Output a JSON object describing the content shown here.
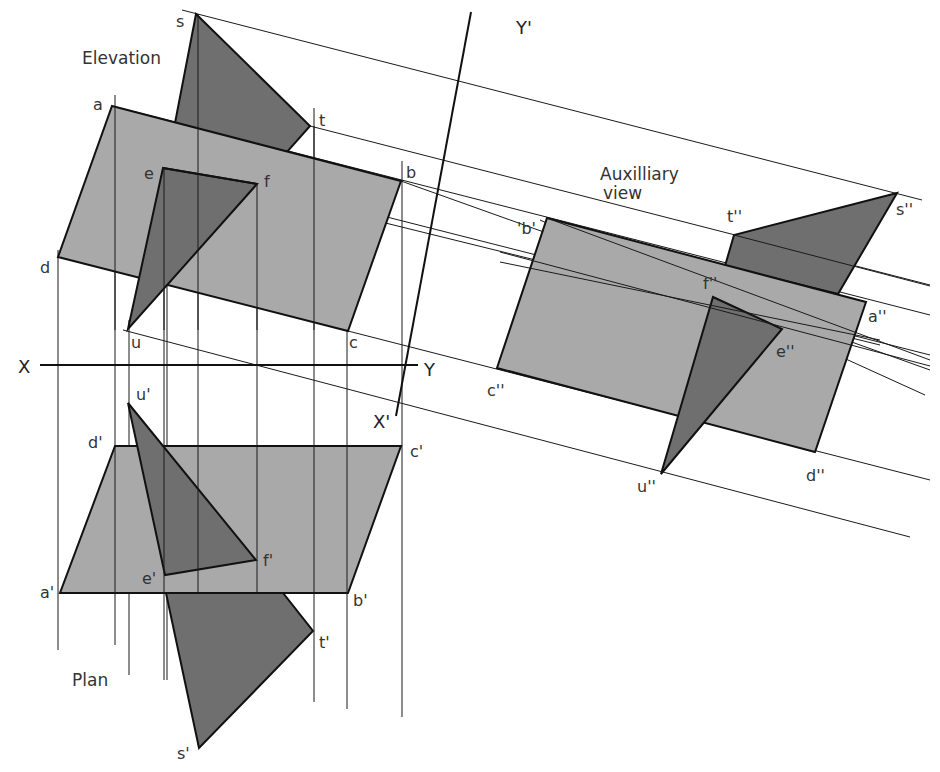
{
  "diagram": {
    "type": "orthographic-projection-with-auxiliary-view",
    "view_titles": {
      "elevation": "Elevation",
      "plan": "Plan",
      "auxiliary_line1": "Auxilliary",
      "auxiliary_line2": "view"
    },
    "reference_lines": {
      "x": "X",
      "y": "Y",
      "x_prime": "X'",
      "y_prime": "Y'"
    },
    "elevation_points": {
      "a": "a",
      "b": "b",
      "c": "c",
      "d": "d",
      "e": "e",
      "f": "f",
      "s": "s",
      "t": "t",
      "u": "u"
    },
    "plan_points": {
      "a": "a'",
      "b": "b'",
      "c": "c'",
      "d": "d'",
      "e": "e'",
      "f": "f'",
      "s": "s'",
      "t": "t'",
      "u": "u'"
    },
    "auxiliary_points": {
      "a": "a''",
      "b": "'b'",
      "c": "c''",
      "d": "d''",
      "e": "e''",
      "f": "f''",
      "s": "s''",
      "t": "t''",
      "u": "u''"
    },
    "colors": {
      "plane_fill": "#a9a9a9",
      "triangle_fill": "#6f6f6f",
      "line": "#111111",
      "background": "#ffffff"
    }
  }
}
